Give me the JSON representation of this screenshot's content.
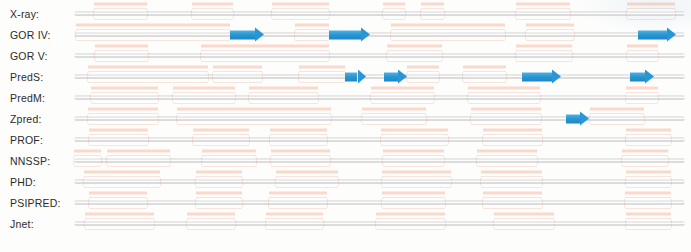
{
  "figure": {
    "colors": {
      "helix": "#ec6e46",
      "strand": "#2b96d4",
      "coil": "#d5d6d5",
      "background": "#fdfdfc",
      "label_text": "#2b2b2b"
    },
    "legend_semantics": {
      "helix": "alpha-helix (orange cylinder)",
      "strand": "beta-strand (blue arrow)",
      "coil": "coil / loop (grey line)"
    },
    "track": {
      "x_start_px": 74,
      "x_end_px": 685,
      "units": "percent of sequence length"
    },
    "rows": [
      {
        "label": "X-ray:",
        "name": "x-ray",
        "elements": [
          {
            "type": "helix",
            "start": 8.0,
            "end": 29.5
          },
          {
            "type": "helix",
            "start": 48.0,
            "end": 64.5
          },
          {
            "type": "helix",
            "start": 80.5,
            "end": 103.5
          },
          {
            "type": "helix",
            "start": 125.5,
            "end": 134.5
          },
          {
            "type": "helix",
            "start": 141.0,
            "end": 150.0
          },
          {
            "type": "helix",
            "start": 179.5,
            "end": 201.5
          },
          {
            "type": "helix",
            "start": 224.5,
            "end": 244.0
          }
        ]
      },
      {
        "label": "GOR IV:",
        "name": "gor-iv",
        "elements": [
          {
            "type": "helix",
            "start": 1.0,
            "end": 63.5
          },
          {
            "type": "strand",
            "start": 63.5,
            "end": 77.0
          },
          {
            "type": "helix",
            "start": 89.5,
            "end": 103.5
          },
          {
            "type": "strand",
            "start": 103.5,
            "end": 120.0
          },
          {
            "type": "helix",
            "start": 128.5,
            "end": 175.0
          },
          {
            "type": "helix",
            "start": 183.5,
            "end": 203.0
          },
          {
            "type": "strand",
            "start": 229.0,
            "end": 244.5
          }
        ]
      },
      {
        "label": "GOR V:",
        "name": "gor-v",
        "elements": [
          {
            "type": "helix",
            "start": 8.5,
            "end": 30.0
          },
          {
            "type": "helix",
            "start": 51.5,
            "end": 103.5
          },
          {
            "type": "helix",
            "start": 127.0,
            "end": 149.5
          },
          {
            "type": "helix",
            "start": 179.5,
            "end": 202.0
          },
          {
            "type": "helix",
            "start": 224.5,
            "end": 237.0
          }
        ]
      },
      {
        "label": "PredS:",
        "name": "preds",
        "elements": [
          {
            "type": "helix",
            "start": 5.5,
            "end": 54.5
          },
          {
            "type": "helix",
            "start": 56.5,
            "end": 76.5
          },
          {
            "type": "helix",
            "start": 91.5,
            "end": 110.0
          },
          {
            "type": "strand",
            "start": 110.0,
            "end": 118.5
          },
          {
            "type": "strand",
            "start": 126.0,
            "end": 135.0
          },
          {
            "type": "helix",
            "start": 135.0,
            "end": 148.0
          },
          {
            "type": "helix",
            "start": 158.0,
            "end": 175.5
          },
          {
            "type": "strand",
            "start": 182.0,
            "end": 197.5
          },
          {
            "type": "strand",
            "start": 225.5,
            "end": 235.5
          }
        ]
      },
      {
        "label": "PredM:",
        "name": "predm",
        "elements": [
          {
            "type": "helix",
            "start": 7.0,
            "end": 34.0
          },
          {
            "type": "helix",
            "start": 40.0,
            "end": 65.5
          },
          {
            "type": "helix",
            "start": 71.0,
            "end": 99.0
          },
          {
            "type": "helix",
            "start": 120.5,
            "end": 146.0
          },
          {
            "type": "helix",
            "start": 160.0,
            "end": 189.0
          },
          {
            "type": "helix",
            "start": 224.0,
            "end": 237.0
          }
        ]
      },
      {
        "label": "Zpred:",
        "name": "zpred",
        "elements": [
          {
            "type": "helix",
            "start": 5.5,
            "end": 34.0
          },
          {
            "type": "helix",
            "start": 42.0,
            "end": 104.5
          },
          {
            "type": "helix",
            "start": 117.0,
            "end": 143.0
          },
          {
            "type": "helix",
            "start": 161.0,
            "end": 189.5
          },
          {
            "type": "strand",
            "start": 199.5,
            "end": 209.0
          },
          {
            "type": "helix",
            "start": 209.5,
            "end": 231.5
          }
        ]
      },
      {
        "label": "PROF:",
        "name": "prof",
        "elements": [
          {
            "type": "helix",
            "start": 6.0,
            "end": 30.0
          },
          {
            "type": "helix",
            "start": 48.5,
            "end": 71.0
          },
          {
            "type": "helix",
            "start": 79.5,
            "end": 102.5
          },
          {
            "type": "helix",
            "start": 124.5,
            "end": 152.0
          },
          {
            "type": "helix",
            "start": 166.0,
            "end": 190.0
          },
          {
            "type": "helix",
            "start": 224.0,
            "end": 242.5
          }
        ]
      },
      {
        "label": "NNSSP:",
        "name": "nnssp",
        "elements": [
          {
            "type": "helix",
            "start": 0.0,
            "end": 11.0
          },
          {
            "type": "helix",
            "start": 13.5,
            "end": 39.0
          },
          {
            "type": "helix",
            "start": 52.0,
            "end": 74.0
          },
          {
            "type": "helix",
            "start": 80.0,
            "end": 104.0
          },
          {
            "type": "helix",
            "start": 125.5,
            "end": 150.0
          },
          {
            "type": "helix",
            "start": 163.5,
            "end": 188.0
          },
          {
            "type": "helix",
            "start": 222.5,
            "end": 241.0
          }
        ]
      },
      {
        "label": "PHD:",
        "name": "phd",
        "elements": [
          {
            "type": "helix",
            "start": 4.0,
            "end": 35.0
          },
          {
            "type": "helix",
            "start": 49.5,
            "end": 68.0
          },
          {
            "type": "helix",
            "start": 82.0,
            "end": 107.0
          },
          {
            "type": "helix",
            "start": 125.0,
            "end": 153.0
          },
          {
            "type": "helix",
            "start": 165.0,
            "end": 190.0
          },
          {
            "type": "helix",
            "start": 224.0,
            "end": 242.5
          }
        ]
      },
      {
        "label": "PSIPRED:",
        "name": "psipred",
        "elements": [
          {
            "type": "helix",
            "start": 6.0,
            "end": 29.5
          },
          {
            "type": "helix",
            "start": 49.5,
            "end": 68.0
          },
          {
            "type": "helix",
            "start": 79.0,
            "end": 102.5
          },
          {
            "type": "helix",
            "start": 125.0,
            "end": 150.5
          },
          {
            "type": "helix",
            "start": 166.0,
            "end": 190.0
          },
          {
            "type": "helix",
            "start": 223.5,
            "end": 242.5
          }
        ]
      },
      {
        "label": "Jnet:",
        "name": "jnet",
        "elements": [
          {
            "type": "helix",
            "start": 4.5,
            "end": 32.5
          },
          {
            "type": "helix",
            "start": 46.0,
            "end": 65.5
          },
          {
            "type": "helix",
            "start": 78.0,
            "end": 101.0
          },
          {
            "type": "helix",
            "start": 122.5,
            "end": 150.5
          },
          {
            "type": "helix",
            "start": 170.5,
            "end": 195.0
          },
          {
            "type": "helix",
            "start": 224.0,
            "end": 242.5
          }
        ]
      }
    ]
  }
}
